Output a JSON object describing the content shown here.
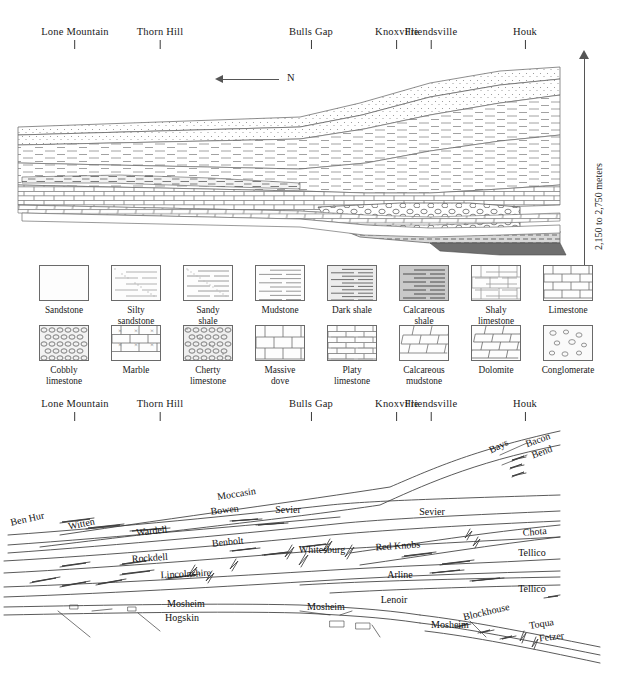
{
  "figure": {
    "type": "geologic-cross-section",
    "scale_label": "2,150 to 2,750 meters",
    "north_label": "N"
  },
  "locations": [
    {
      "name": "Lone Mountain",
      "x": 75
    },
    {
      "name": "Thorn Hill",
      "x": 160
    },
    {
      "name": "Bulls Gap",
      "x": 311
    },
    {
      "name": "Knoxville",
      "x": 397
    },
    {
      "name": "Friendsville",
      "x": 431
    },
    {
      "name": "Houk",
      "x": 525
    }
  ],
  "legend": {
    "row1": [
      {
        "label": "Sandstone",
        "pattern": "sandstone",
        "x": 40
      },
      {
        "label": "Silty\nsandstone",
        "pattern": "silty-sandstone",
        "x": 112
      },
      {
        "label": "Sandy\nshale",
        "pattern": "sandy-shale",
        "x": 184
      },
      {
        "label": "Mudstone",
        "pattern": "mudstone",
        "x": 256
      },
      {
        "label": "Dark shale",
        "pattern": "dark-shale",
        "x": 328
      },
      {
        "label": "Calcareous\nshale",
        "pattern": "calcareous-shale",
        "x": 400
      },
      {
        "label": "Shaly\nlimestone",
        "pattern": "shaly-limestone",
        "x": 472
      },
      {
        "label": "Limestone",
        "pattern": "limestone",
        "x": 544
      }
    ],
    "row2": [
      {
        "label": "Cobbly\nlimestone",
        "pattern": "cobbly-limestone",
        "x": 40
      },
      {
        "label": "Marble",
        "pattern": "marble",
        "x": 112
      },
      {
        "label": "Cherty\nlimestone",
        "pattern": "cherty-limestone",
        "x": 184
      },
      {
        "label": "Massive\ndove",
        "pattern": "massive-dove",
        "x": 256
      },
      {
        "label": "Platy\nlimestone",
        "pattern": "platy-limestone",
        "x": 328
      },
      {
        "label": "Calcareous\nmudstone",
        "pattern": "calcareous-mudstone",
        "x": 400
      },
      {
        "label": "Dolomite",
        "pattern": "dolomite",
        "x": 472
      },
      {
        "label": "Conglomerate",
        "pattern": "conglomerate",
        "x": 544
      }
    ]
  },
  "formations": [
    {
      "name": "Bays",
      "x": 500,
      "y": 449,
      "rot": -26
    },
    {
      "name": "Bacon",
      "x": 539,
      "y": 443,
      "rot": -20
    },
    {
      "name": "Bend",
      "x": 543,
      "y": 455,
      "rot": -20
    },
    {
      "name": "Moccasin",
      "x": 237,
      "y": 497,
      "rot": -9
    },
    {
      "name": "Ben Hur",
      "x": 28,
      "y": 522,
      "rot": -13
    },
    {
      "name": "Witten",
      "x": 82,
      "y": 527,
      "rot": -12
    },
    {
      "name": "Bowen",
      "x": 225,
      "y": 513,
      "rot": -7
    },
    {
      "name": "Sevier",
      "x": 288,
      "y": 513,
      "rot": 0
    },
    {
      "name": "Sevier",
      "x": 432,
      "y": 515,
      "rot": 0
    },
    {
      "name": "Wardell",
      "x": 152,
      "y": 534,
      "rot": -6
    },
    {
      "name": "Benbolt",
      "x": 228,
      "y": 545,
      "rot": -6
    },
    {
      "name": "Whitesburg",
      "x": 322,
      "y": 553,
      "rot": 0
    },
    {
      "name": "Red Knobs",
      "x": 398,
      "y": 549,
      "rot": -4
    },
    {
      "name": "Chota",
      "x": 535,
      "y": 535,
      "rot": -5
    },
    {
      "name": "Tellico",
      "x": 532,
      "y": 556,
      "rot": 0
    },
    {
      "name": "Rockdell",
      "x": 150,
      "y": 561,
      "rot": -4
    },
    {
      "name": "Lincolnshire",
      "x": 186,
      "y": 577,
      "rot": -3
    },
    {
      "name": "Arline",
      "x": 400,
      "y": 578,
      "rot": 0
    },
    {
      "name": "Tellico",
      "x": 532,
      "y": 592,
      "rot": 0
    },
    {
      "name": "Mosheim",
      "x": 186,
      "y": 607,
      "rot": 0
    },
    {
      "name": "Hogskin",
      "x": 182,
      "y": 621,
      "rot": 0
    },
    {
      "name": "Mosheim",
      "x": 326,
      "y": 610,
      "rot": 0
    },
    {
      "name": "Lenoir",
      "x": 394,
      "y": 603,
      "rot": 0
    },
    {
      "name": "Mosheim",
      "x": 450,
      "y": 628,
      "rot": 0
    },
    {
      "name": "Blockhouse",
      "x": 487,
      "y": 615,
      "rot": -13
    },
    {
      "name": "Toqua",
      "x": 542,
      "y": 627,
      "rot": -9
    },
    {
      "name": "Fetzer",
      "x": 552,
      "y": 640,
      "rot": -7
    }
  ]
}
